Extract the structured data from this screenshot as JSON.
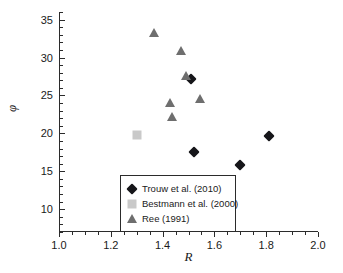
{
  "chart_data": {
    "type": "scatter",
    "title": "",
    "xlabel": "R",
    "ylabel": "φ",
    "xlim": [
      1.0,
      2.0
    ],
    "ylim": [
      7.0,
      36.0
    ],
    "grid": false,
    "legend_position": "lower-left",
    "xticks": [
      {
        "value": 1.0,
        "label": "1.0"
      },
      {
        "value": 1.2,
        "label": "1.2"
      },
      {
        "value": 1.4,
        "label": "1.4"
      },
      {
        "value": 1.6,
        "label": "1.6"
      },
      {
        "value": 1.8,
        "label": "1.8"
      },
      {
        "value": 2.0,
        "label": "2.0"
      }
    ],
    "xminor_step": 0.05,
    "yticks": [
      {
        "value": 10,
        "label": "10"
      },
      {
        "value": 15,
        "label": "15"
      },
      {
        "value": 20,
        "label": "20"
      },
      {
        "value": 25,
        "label": "25"
      },
      {
        "value": 30,
        "label": "30"
      },
      {
        "value": 35,
        "label": "35"
      }
    ],
    "yminor_step": 1,
    "series": [
      {
        "name": "Trouw et al. (2010)",
        "marker": "diamond",
        "color": "#16161a",
        "points": [
          {
            "x": 1.51,
            "y": 27.2
          },
          {
            "x": 1.52,
            "y": 17.5
          },
          {
            "x": 1.7,
            "y": 15.8
          },
          {
            "x": 1.81,
            "y": 19.6
          }
        ]
      },
      {
        "name": "Bestmann et al. (2000)",
        "marker": "square",
        "color": "#c9c9c9",
        "points": [
          {
            "x": 1.3,
            "y": 19.8
          }
        ]
      },
      {
        "name": "Ree (1991)",
        "marker": "triangle",
        "color": "#6e6e6e",
        "points": [
          {
            "x": 1.365,
            "y": 33.2
          },
          {
            "x": 1.47,
            "y": 30.8
          },
          {
            "x": 1.49,
            "y": 27.6
          },
          {
            "x": 1.43,
            "y": 24.0
          },
          {
            "x": 1.435,
            "y": 22.2
          },
          {
            "x": 1.545,
            "y": 24.5
          }
        ]
      }
    ]
  }
}
